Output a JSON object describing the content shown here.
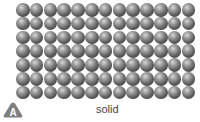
{
  "figure": {
    "panel_letter": "A",
    "caption": "solid",
    "particle_grid": {
      "rows": 7,
      "columns": 13,
      "particle_color": "#6a6a6a"
    },
    "badge_color": "#7f7f7f"
  }
}
